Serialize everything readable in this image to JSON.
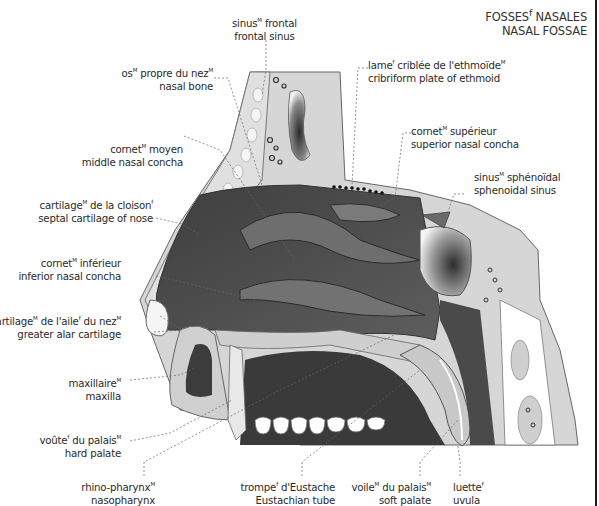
{
  "title": {
    "fr": "FOSSES",
    "fr_sup": "f",
    "fr_rest": " NASALES",
    "en": "NASAL FOSSAE"
  },
  "labels": [
    {
      "id": "frontal-sinus",
      "fr": "sinus",
      "fr_sup": "M",
      "fr_rest": " frontal",
      "en": "frontal sinus"
    },
    {
      "id": "cribriform-plate",
      "fr": "lame",
      "fr_sup": "f",
      "fr_rest": " criblée de l'ethmoïde",
      "fr_sup2": "M",
      "en": "cribriform plate of ethmoid"
    },
    {
      "id": "nasal-bone",
      "fr": "os",
      "fr_sup": "M",
      "fr_rest": " propre du nez",
      "fr_sup2": "M",
      "en": "nasal bone"
    },
    {
      "id": "superior-nasal-concha",
      "fr": "cornet",
      "fr_sup": "M",
      "fr_rest": " supérieur",
      "en": "superior nasal concha"
    },
    {
      "id": "middle-nasal-concha",
      "fr": "cornet",
      "fr_sup": "M",
      "fr_rest": " moyen",
      "en": "middle nasal concha"
    },
    {
      "id": "sphenoidal-sinus",
      "fr": "sinus",
      "fr_sup": "M",
      "fr_rest": " sphénoïdal",
      "en": "sphenoidal sinus"
    },
    {
      "id": "septal-cartilage",
      "fr": "cartilage",
      "fr_sup": "M",
      "fr_rest": " de la cloison",
      "fr_sup2": "f",
      "en": "septal cartilage of nose"
    },
    {
      "id": "inferior-nasal-concha",
      "fr": "cornet",
      "fr_sup": "M",
      "fr_rest": " inférieur",
      "en": "inferior nasal concha"
    },
    {
      "id": "greater-alar-cartilage",
      "fr": "cartilage",
      "fr_sup": "M",
      "fr_rest": " de l'aile",
      "fr_sup2": "f",
      "fr_rest2": " du nez",
      "fr_sup3": "M",
      "en": "greater alar cartilage"
    },
    {
      "id": "maxilla",
      "fr": "maxillaire",
      "fr_sup": "M",
      "en": "maxilla"
    },
    {
      "id": "hard-palate",
      "fr": "voûte",
      "fr_sup": "f",
      "fr_rest": " du palais",
      "fr_sup2": "M",
      "en": "hard palate"
    },
    {
      "id": "nasopharynx",
      "fr": "rhino-pharynx",
      "fr_sup": "M",
      "en": "nasopharynx"
    },
    {
      "id": "eustachian-tube",
      "fr": "trompe",
      "fr_sup": "f",
      "fr_rest": " d'Eustache",
      "en": "Eustachian tube"
    },
    {
      "id": "soft-palate",
      "fr": "voile",
      "fr_sup": "M",
      "fr_rest": " du palais",
      "fr_sup2": "M",
      "en": "soft palate"
    },
    {
      "id": "uvula",
      "fr": "luette",
      "fr_sup": "f",
      "en": "uvula"
    }
  ],
  "colors": {
    "bone": "#d4d4d4",
    "cavity": "#5a5a5a",
    "cavity_dark": "#3a3a3a",
    "outline": "#555555",
    "leader": "#666666",
    "white": "#ffffff"
  }
}
